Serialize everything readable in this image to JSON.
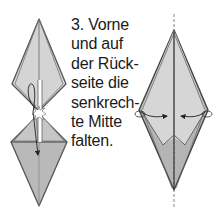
{
  "step": {
    "number": "3.",
    "lines": [
      "3. Vorne",
      "und auf",
      "der Rück-",
      "seite die",
      "senkrech-",
      "te Mitte",
      "falten."
    ],
    "full_text": "3. Vorne und auf der Rückseite die senkrechte Mitte falten."
  },
  "figures": {
    "left": {
      "description": "two kite shapes joined at waist with folding arrow",
      "upper_kite": "upper-kite",
      "lower_kite": "lower-kite",
      "arrow": "valley-fold-arrow"
    },
    "right": {
      "description": "diamond with dashed vertical center line and two inward fold arrows",
      "center_line": "dashed",
      "arrows": [
        "left-inward-fold-arrow",
        "right-inward-fold-arrow"
      ]
    }
  },
  "colors": {
    "paper_light": "#d6d6d6",
    "paper_mid": "#c2c2c2",
    "paper_dark": "#a9a9a9",
    "outline": "#444444",
    "text": "#1a1a1a",
    "background": "#ffffff"
  }
}
